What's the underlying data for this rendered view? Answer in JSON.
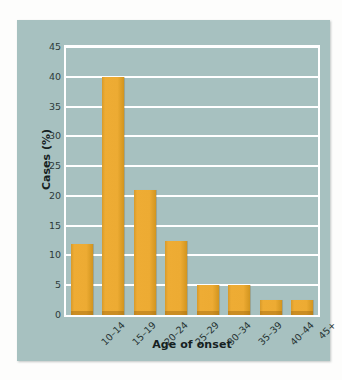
{
  "chart_data": {
    "type": "bar",
    "title": "",
    "xlabel": "Age of onset",
    "ylabel": "Cases (%)",
    "categories": [
      "10–14",
      "15–19",
      "20–24",
      "25–29",
      "30–34",
      "35–39",
      "40–44",
      "45+"
    ],
    "values": [
      12,
      40,
      21,
      12.5,
      5,
      5,
      2.5,
      2.5
    ],
    "ylim": [
      0,
      45
    ],
    "ytick_labels": [
      "0",
      "5",
      "10",
      "15",
      "20",
      "25",
      "30",
      "35",
      "40",
      "45"
    ],
    "ytick_values": [
      0,
      5,
      10,
      15,
      20,
      25,
      30,
      35,
      40,
      45
    ],
    "grid": true,
    "legend": null,
    "colors": {
      "bar": "#eeab33",
      "bar_edge": "#d2951f",
      "plot_background": "#a7c1c0",
      "panel_background": "#a7c1c0",
      "gridline": "#ffffff",
      "text": "#1d2a2a",
      "page_background": "#ffffff"
    }
  }
}
